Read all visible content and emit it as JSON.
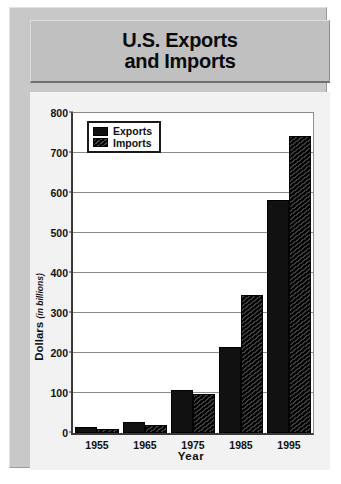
{
  "title": {
    "line1": "U.S. Exports",
    "line2": "and Imports"
  },
  "chart_data": {
    "type": "bar",
    "title": "U.S. Exports and Imports",
    "xlabel": "Year",
    "ylabel": "Dollars",
    "ylabel_sub": "(in billions)",
    "categories": [
      "1955",
      "1965",
      "1975",
      "1985",
      "1995"
    ],
    "series": [
      {
        "name": "Exports",
        "values": [
          14,
          27,
          108,
          215,
          583
        ]
      },
      {
        "name": "Imports",
        "values": [
          11,
          21,
          98,
          345,
          743
        ]
      }
    ],
    "ylim": [
      0,
      800
    ],
    "yticks": [
      0,
      100,
      200,
      300,
      400,
      500,
      600,
      700,
      800
    ],
    "grid": true,
    "legend_position": "top-left"
  },
  "legend": {
    "items": [
      {
        "label": "Exports",
        "swatch": "solid-dark-swatch"
      },
      {
        "label": "Imports",
        "swatch": "hatched-dark-swatch"
      }
    ]
  }
}
